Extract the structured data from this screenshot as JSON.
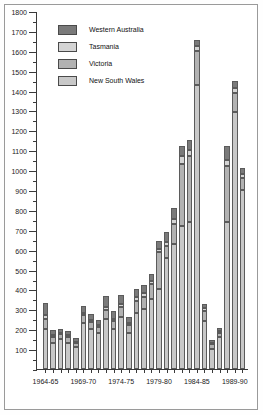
{
  "chart_data": {
    "type": "bar",
    "subtype": "stacked-bar",
    "title": "",
    "xlabel": "",
    "ylabel": "",
    "ylim": [
      0,
      1800
    ],
    "ytick_step": 100,
    "yticks": [
      0,
      100,
      200,
      300,
      400,
      500,
      600,
      700,
      800,
      900,
      1000,
      1100,
      1200,
      1300,
      1400,
      1500,
      1600,
      1700,
      1800
    ],
    "ytick_labels": [
      "",
      "100",
      "200",
      "300",
      "400",
      "500",
      "600",
      "700",
      "800",
      "900",
      "1000",
      "1100",
      "1200",
      "1300",
      "1400",
      "1500",
      "1600",
      "1700",
      "1800"
    ],
    "grid": false,
    "legend_position": "top-left",
    "categories": [
      "1964-65",
      "1965-66",
      "1966-67",
      "1967-68",
      "1968-69",
      "1969-70",
      "1970-71",
      "1971-72",
      "1972-73",
      "1973-74",
      "1974-75",
      "1975-76",
      "1976-77",
      "1977-78",
      "1978-79",
      "1979-80",
      "1980-81",
      "1981-82",
      "1982-83",
      "1983-84",
      "1984-85",
      "1985-86",
      "1986-87",
      "1987-88",
      "1988-89",
      "1989-90",
      "1990-91"
    ],
    "xtick_labels": [
      "1964-65",
      "1969-70",
      "1974-75",
      "1979-80",
      "1984-85",
      "1989-90"
    ],
    "xtick_indices": [
      0,
      5,
      10,
      15,
      20,
      25
    ],
    "series": [
      {
        "name": "New South Wales",
        "color": "#c8c8c8",
        "values": [
          200,
          130,
          150,
          130,
          110,
          230,
          200,
          180,
          250,
          200,
          260,
          180,
          280,
          300,
          350,
          400,
          560,
          630,
          720,
          740,
          1430,
          240,
          100,
          160,
          740,
          1290,
          900
        ]
      },
      {
        "name": "Victoria",
        "color": "#b2b2b2",
        "values": [
          50,
          30,
          25,
          30,
          20,
          40,
          35,
          30,
          45,
          40,
          50,
          40,
          60,
          60,
          75,
          190,
          60,
          100,
          310,
          330,
          170,
          50,
          25,
          20,
          280,
          100,
          60
        ]
      },
      {
        "name": "Tasmania",
        "color": "#d4d4d4",
        "values": [
          20,
          10,
          8,
          10,
          8,
          12,
          10,
          10,
          15,
          12,
          15,
          10,
          20,
          20,
          20,
          15,
          20,
          25,
          40,
          30,
          25,
          15,
          8,
          10,
          30,
          25,
          20
        ]
      },
      {
        "name": "Western Australia",
        "color": "#7a7a7a",
        "values": [
          60,
          25,
          20,
          20,
          20,
          35,
          30,
          25,
          55,
          40,
          45,
          30,
          40,
          40,
          35,
          40,
          50,
          55,
          50,
          50,
          30,
          20,
          12,
          18,
          70,
          35,
          30
        ]
      }
    ],
    "totals": [
      330,
      195,
      203,
      190,
      158,
      317,
      275,
      245,
      365,
      292,
      370,
      260,
      400,
      420,
      480,
      645,
      690,
      810,
      1120,
      1150,
      1655,
      325,
      145,
      208,
      1120,
      1450,
      1010
    ]
  },
  "legend": {
    "items": [
      {
        "label": "Western Australia",
        "color": "#7a7a7a"
      },
      {
        "label": "Tasmania",
        "color": "#d4d4d4"
      },
      {
        "label": "Victoria",
        "color": "#b2b2b2"
      },
      {
        "label": "New South Wales",
        "color": "#c8c8c8"
      }
    ]
  }
}
